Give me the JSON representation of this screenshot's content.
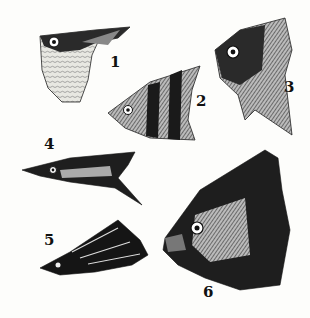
{
  "plate": {
    "description": "Engraved plate of six fish heads/fore-bodies",
    "background": "#fdfdfb",
    "ink": "#111111"
  },
  "figures": [
    {
      "label": "1",
      "label_pos": [
        110,
        60
      ],
      "subject": "hatchetfish-like deep-bellied fish"
    },
    {
      "label": "2",
      "label_pos": [
        196,
        96
      ],
      "subject": "banded angelfish-like fish"
    },
    {
      "label": "3",
      "label_pos": [
        283,
        81
      ],
      "subject": "deep-bodied fish head, front-right view"
    },
    {
      "label": "4",
      "label_pos": [
        44,
        141
      ],
      "subject": "elongated pike-characin"
    },
    {
      "label": "5",
      "label_pos": [
        44,
        237
      ],
      "subject": "slender dark striped fish"
    },
    {
      "label": "6",
      "label_pos": [
        202,
        284
      ],
      "subject": "piranha-like fish head"
    }
  ]
}
